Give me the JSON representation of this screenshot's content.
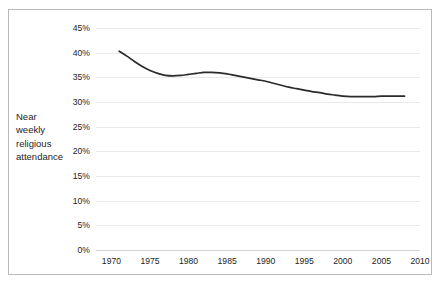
{
  "figure": {
    "axis_caption": "Near\nweekly\nreligious\nattendance"
  },
  "chart_data": {
    "type": "line",
    "title": "",
    "subtitle": "",
    "xlabel": "",
    "ylabel": "Near weekly religious attendance",
    "xlim": [
      1968,
      2010
    ],
    "ylim": [
      0,
      45
    ],
    "grid": true,
    "legend": false,
    "line_color": "#2b2b2b",
    "gridline_color": "#e9e9e9",
    "x_tick_labels": [
      "1970",
      "1975",
      "1980",
      "1985",
      "1990",
      "1995",
      "2000",
      "2005",
      "2010"
    ],
    "x_ticks": [
      1970,
      1975,
      1980,
      1985,
      1990,
      1995,
      2000,
      2005,
      2010
    ],
    "y_tick_labels": [
      "0%",
      "5%",
      "10%",
      "15%",
      "20%",
      "25%",
      "30%",
      "35%",
      "40%",
      "45%"
    ],
    "y_ticks": [
      0,
      5,
      10,
      15,
      20,
      25,
      30,
      35,
      40,
      45
    ],
    "series": [
      {
        "name": "Near weekly religious attendance",
        "x": [
          1971,
          1972,
          1973,
          1974,
          1975,
          1976,
          1977,
          1978,
          1979,
          1980,
          1981,
          1982,
          1983,
          1984,
          1985,
          1986,
          1987,
          1988,
          1989,
          1990,
          1991,
          1992,
          1993,
          1994,
          1995,
          1996,
          1997,
          1998,
          1999,
          2000,
          2001,
          2002,
          2003,
          2004,
          2005,
          2006,
          2007,
          2008
        ],
        "values": [
          40.3,
          39.3,
          38.2,
          37.2,
          36.4,
          35.8,
          35.4,
          35.3,
          35.4,
          35.6,
          35.8,
          36.0,
          36.0,
          35.9,
          35.7,
          35.4,
          35.1,
          34.8,
          34.5,
          34.2,
          33.8,
          33.4,
          33.0,
          32.7,
          32.4,
          32.1,
          31.9,
          31.6,
          31.4,
          31.2,
          31.1,
          31.1,
          31.1,
          31.1,
          31.2,
          31.2,
          31.2,
          31.2
        ]
      }
    ]
  }
}
